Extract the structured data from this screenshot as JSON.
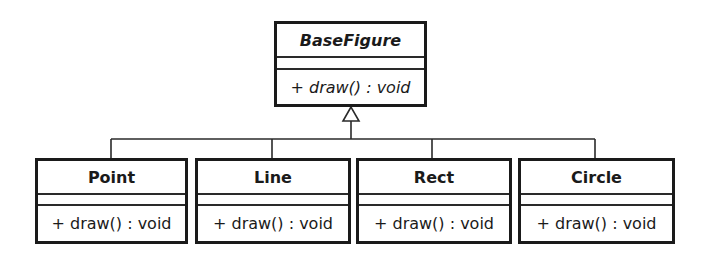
{
  "diagram": {
    "type": "uml-class-diagram",
    "relationship": "generalization",
    "parent": {
      "name": "BaseFigure",
      "abstract": true,
      "attributes": [],
      "operations": [
        "+ draw() : void"
      ]
    },
    "children": [
      {
        "name": "Point",
        "attributes": [],
        "operations": [
          "+ draw() : void"
        ]
      },
      {
        "name": "Line",
        "attributes": [],
        "operations": [
          "+ draw() : void"
        ]
      },
      {
        "name": "Rect",
        "attributes": [],
        "operations": [
          "+ draw() : void"
        ]
      },
      {
        "name": "Circle",
        "attributes": [],
        "operations": [
          "+ draw() : void"
        ]
      }
    ],
    "colors": {
      "stroke": "#1a1a1a",
      "background": "#ffffff"
    }
  }
}
